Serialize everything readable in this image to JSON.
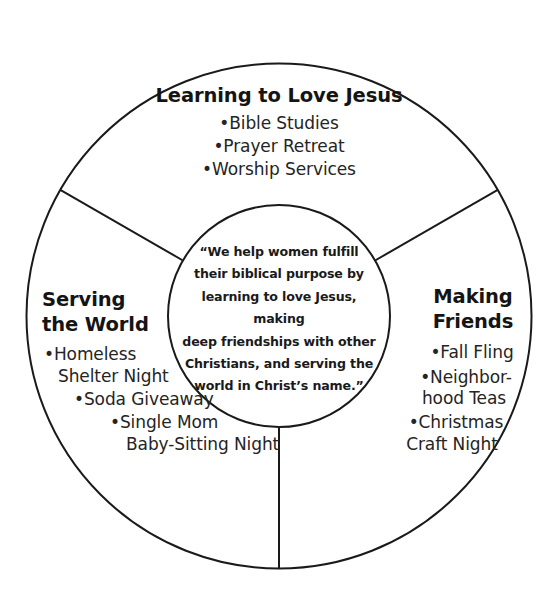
{
  "diagram": {
    "shape": "three-segment circle with central hub",
    "stroke_color": "#1a1a1a",
    "background_color": "#ffffff",
    "center": {
      "name": "mission-statement",
      "lines": [
        "“We help women fulfill",
        "their biblical purpose by",
        "learning to love Jesus, making",
        "deep friendships with other",
        "Christians, and serving the",
        "world in Christ’s name.”"
      ]
    },
    "segments": [
      {
        "id": "learning-to-love-jesus",
        "heading": "Learning to Love Jesus",
        "items": [
          "•Bible Studies",
          "•Prayer Retreat",
          "•Worship Services"
        ]
      },
      {
        "id": "serving-the-world",
        "heading_lines": [
          "Serving",
          "the World"
        ],
        "item_lines": [
          "•Homeless",
          "Shelter Night",
          "•Soda Giveaway",
          "•Single Mom",
          "Baby-Sitting Night"
        ]
      },
      {
        "id": "making-friends",
        "heading_lines": [
          "Making",
          "Friends"
        ],
        "item_lines": [
          "•Fall Fling",
          "•Neighbor-",
          "hood Teas",
          "•Christmas",
          "Craft Night"
        ]
      }
    ]
  }
}
